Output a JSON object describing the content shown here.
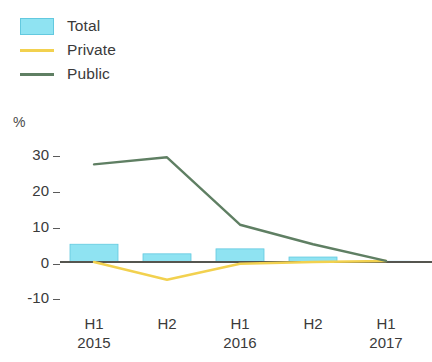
{
  "legend": {
    "items": [
      {
        "label": "Total",
        "marker": "box",
        "color": "#8fe3f2",
        "icon": "legend-swatch-box-icon"
      },
      {
        "label": "Private",
        "marker": "line",
        "color": "#f2d14f",
        "icon": "legend-swatch-line-icon"
      },
      {
        "label": "Public",
        "marker": "line",
        "color": "#5f7f63",
        "icon": "legend-swatch-line-icon"
      }
    ]
  },
  "axis": {
    "unit_label": "%",
    "y_ticks": [
      "30",
      "20",
      "10",
      "0",
      "-10"
    ],
    "x_periods": [
      "H1",
      "H2",
      "H1",
      "H2",
      "H1"
    ],
    "x_years": [
      "2015",
      "",
      "2016",
      "",
      "2017"
    ]
  },
  "chart_data": {
    "type": "bar",
    "title": "",
    "subtitle": "",
    "xlabel": "",
    "ylabel": "%",
    "ylim": [
      -10,
      30
    ],
    "yticks": [
      -10,
      0,
      10,
      20,
      30
    ],
    "grid": false,
    "legend_position": "top-left",
    "categories": [
      "H1 2015",
      "H2 2015",
      "H1 2016",
      "H2 2016",
      "H1 2017"
    ],
    "series": [
      {
        "name": "Total",
        "type": "bar",
        "color": "#8fe3f2",
        "values": [
          5.0,
          2.3,
          3.7,
          1.4,
          0.2
        ]
      },
      {
        "name": "Private",
        "type": "line",
        "color": "#f2d14f",
        "values": [
          0.0,
          -5.0,
          -0.5,
          0.0,
          0.3
        ]
      },
      {
        "name": "Public",
        "type": "line",
        "color": "#5f7f63",
        "values": [
          27.5,
          29.5,
          10.5,
          5.0,
          0.3
        ]
      }
    ]
  }
}
